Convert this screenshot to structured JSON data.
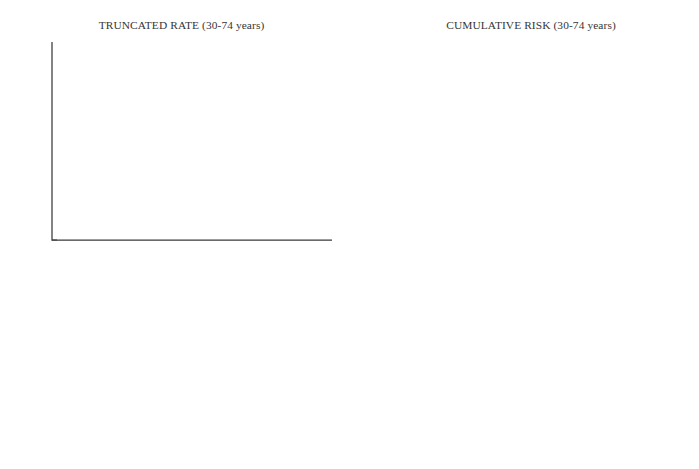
{
  "figure": {
    "width": 699,
    "height": 469
  },
  "panels": [
    {
      "id": "truncated-rate",
      "title": "TRUNCATED RATE (30-74 years)",
      "xlabel": "Calendar period",
      "ylabel": "Rate per 100 000",
      "xticklabels": [
        "1955",
        "1960",
        "1965",
        "1970",
        "1975",
        "1980",
        "1985"
      ],
      "yticklabels": [
        "0.2",
        "1",
        "3"
      ]
    },
    {
      "id": "cumulative-risk",
      "title": "CUMULATIVE RISK (30-74 years)",
      "xlabel": "Year of birth",
      "ylabel": "Risk per 1000",
      "xticklabels": [
        "1910",
        "1920",
        "1930",
        "1940"
      ],
      "yticklabels": [
        "0.1",
        "1",
        "3"
      ]
    }
  ],
  "legend": {
    "left_column": [
      {
        "label": "FRANCE Bas-Rhin",
        "style": "solid",
        "color": "#6b6b6b",
        "width": 1.2
      },
      {
        "label": "FRANCE Doubs",
        "style": "dashed",
        "color": "#6b6b6b",
        "width": 1.2
      },
      {
        "label": "ITALY Varese",
        "style": "dashdot",
        "color": "#6b6b6b",
        "width": 1.2
      },
      {
        "label": "SPAIN Navarra",
        "style": "dashdotdot",
        "color": "#6b6b6b",
        "width": 1.2
      },
      {
        "label": "SPAIN Zaragoza",
        "style": "dotted",
        "color": "#777777",
        "width": 1.2
      },
      {
        "label": "GERMANY (FRG) Hamburg",
        "style": "solid",
        "color": "#9e9e9e",
        "width": 1.2
      }
    ],
    "right_column": [
      {
        "label": "GERMANY (FRG) Saarland",
        "style": "dashed",
        "color": "#9e9e9e",
        "width": 1.2
      },
      {
        "label": "GERMANY (GDR)",
        "style": "dashdot",
        "color": "#9e9e9e",
        "width": 1.2
      },
      {
        "label": "UK Birmingham",
        "style": "solid",
        "color": "#8a8a8a",
        "width": 1.2
      },
      {
        "label": "UK Scotland",
        "style": "dashed",
        "color": "#8a8a8a",
        "width": 1.2
      },
      {
        "label": "UK South Thames",
        "style": "dashdot",
        "color": "#8a8a8a",
        "width": 1.2
      },
      {
        "label": "DENMARK",
        "style": "solid",
        "color": "#000000",
        "width": 2.4,
        "bold": true
      }
    ]
  },
  "chart_data": [
    {
      "type": "line",
      "id": "truncated-rate",
      "title": "TRUNCATED RATE (30-74 years)",
      "xlabel": "Calendar period",
      "ylabel": "Rate per 100 000",
      "xlim": [
        1955,
        1986
      ],
      "ylim": [
        0.2,
        3
      ],
      "yscale": "log",
      "grid": false,
      "legend_position": "below-figure",
      "xticks": [
        1955,
        1960,
        1965,
        1970,
        1975,
        1980,
        1985
      ],
      "yticks": [
        0.2,
        1,
        3
      ],
      "series": [
        {
          "name": "FRANCE Bas-Rhin",
          "x": [
            1961,
            1965,
            1971,
            1975.5,
            1985.5
          ],
          "y": [
            2.05,
            1.62,
            2.0,
            1.55,
            0.55
          ]
        },
        {
          "name": "FRANCE Doubs",
          "x": [
            1977,
            1985.5
          ],
          "y": [
            2.55,
            0.21
          ]
        },
        {
          "name": "ITALY Varese",
          "x": [
            1977,
            1985.5
          ],
          "y": [
            0.22,
            1.5
          ]
        },
        {
          "name": "SPAIN Navarra",
          "x": [
            1963,
            1965,
            1972,
            1980.5,
            1985.5
          ],
          "y": [
            0.52,
            0.93,
            0.88,
            0.6,
            0.41
          ]
        },
        {
          "name": "SPAIN Zaragoza",
          "x": [
            1970.5,
            1985.5
          ],
          "y": [
            2.85,
            1.07
          ]
        },
        {
          "name": "GERMANY (FRG) Hamburg",
          "x": [
            1961,
            1985.5
          ],
          "y": [
            0.55,
            0.55
          ]
        },
        {
          "name": "GERMANY (FRG) Saarland",
          "x": [
            1962,
            1985.5
          ],
          "y": [
            0.81,
            0.5
          ]
        },
        {
          "name": "GERMANY (GDR)",
          "x": [
            1962,
            1985.5
          ],
          "y": [
            0.74,
            0.74
          ]
        },
        {
          "name": "UK Birmingham",
          "x": [
            1962,
            1985.5
          ],
          "y": [
            0.74,
            0.85
          ]
        },
        {
          "name": "UK Scotland",
          "x": [
            1965,
            1985.5
          ],
          "y": [
            0.92,
            0.48
          ]
        },
        {
          "name": "UK South Thames",
          "x": [
            1968,
            1975.5,
            1985.5
          ],
          "y": [
            2.7,
            1.48,
            1.5
          ]
        },
        {
          "name": "DENMARK",
          "x": [
            1955,
            1985.5
          ],
          "y": [
            0.71,
            0.71
          ]
        }
      ]
    },
    {
      "type": "line",
      "id": "cumulative-risk",
      "title": "CUMULATIVE RISK (30-74 years)",
      "xlabel": "Year of birth",
      "ylabel": "Risk per 1000",
      "xlim": [
        1910,
        1940
      ],
      "ylim": [
        0.1,
        3
      ],
      "yscale": "log",
      "grid": false,
      "legend_position": "below-figure",
      "xticks": [
        1910,
        1920,
        1930,
        1940
      ],
      "yticks": [
        0.1,
        1,
        3
      ],
      "series": [
        {
          "name": "FRANCE Bas-Rhin",
          "x": [
            1910,
            1935.5
          ],
          "y": [
            0.97,
            0.45
          ]
        },
        {
          "name": "FRANCE Doubs",
          "x": [
            1915,
            1939.5
          ],
          "y": [
            3.0,
            0.12
          ]
        },
        {
          "name": "ITALY Varese",
          "x": [
            1915,
            1924
          ],
          "y": [
            0.28,
            3.0
          ]
        },
        {
          "name": "SPAIN Navarra",
          "x": [
            1910,
            1940
          ],
          "y": [
            0.5,
            0.22
          ]
        },
        {
          "name": "SPAIN Zaragoza",
          "x": [
            1910,
            1940
          ],
          "y": [
            2.1,
            0.27
          ]
        },
        {
          "name": "GERMANY (FRG) Hamburg",
          "x": [
            1910,
            1940
          ],
          "y": [
            0.3,
            0.3
          ]
        },
        {
          "name": "GERMANY (FRG) Saarland",
          "x": [
            1910,
            1940
          ],
          "y": [
            0.44,
            0.185
          ]
        },
        {
          "name": "GERMANY (GDR)",
          "x": [
            1915,
            1940
          ],
          "y": [
            0.8,
            0.8
          ]
        },
        {
          "name": "UK Birmingham",
          "x": [
            1915,
            1940
          ],
          "y": [
            0.84,
            0.84
          ]
        },
        {
          "name": "UK Scotland",
          "x": [
            1929,
            1939.5
          ],
          "y": [
            3.0,
            0.27
          ]
        },
        {
          "name": "UK South Thames",
          "x": [
            1910,
            1940
          ],
          "y": [
            0.44,
            0.31
          ]
        },
        {
          "name": "DENMARK",
          "x": [
            1910,
            1940
          ],
          "y": [
            0.44,
            0.44
          ]
        }
      ]
    }
  ]
}
